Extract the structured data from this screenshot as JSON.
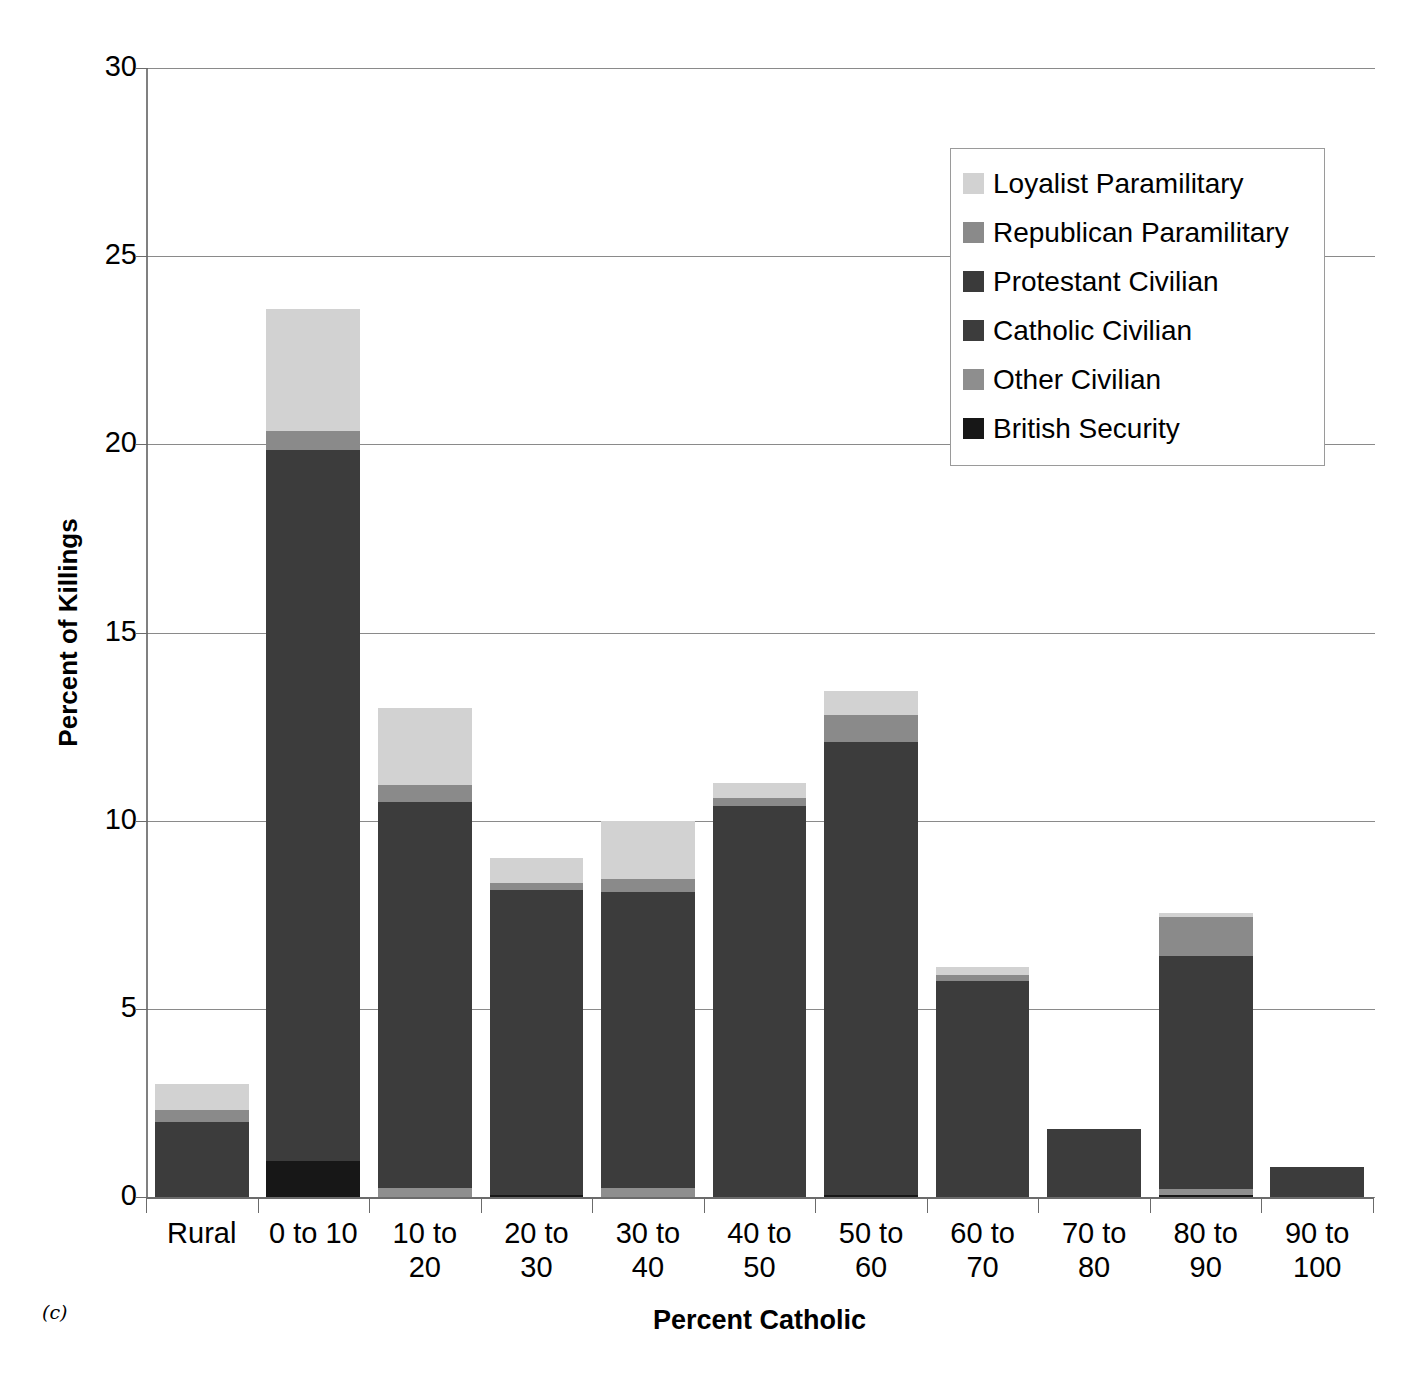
{
  "panel_tag": "(c)",
  "chart_data": {
    "type": "bar",
    "subtype": "stacked-bar",
    "title": "",
    "xlabel": "Percent Catholic",
    "ylabel": "Percent of Killings",
    "ylim": [
      0,
      30
    ],
    "yticks": [
      0,
      5,
      10,
      15,
      20,
      25,
      30
    ],
    "grid": "horizontal",
    "legend_position": "upper-right-inside",
    "categories": [
      "Rural",
      "0 to 10",
      "10 to 20",
      "20 to 30",
      "30 to 40",
      "40 to 50",
      "50 to 60",
      "60 to 70",
      "70 to 80",
      "80 to 90",
      "90 to 100"
    ],
    "series": [
      {
        "name": "British Security",
        "color": "#171717",
        "values": [
          0.0,
          0.95,
          0.0,
          0.05,
          0.0,
          0.0,
          0.05,
          0.0,
          0.0,
          0.05,
          0.0
        ]
      },
      {
        "name": "Other Civilian",
        "color": "#8e8e8e",
        "values": [
          0.0,
          0.0,
          0.25,
          0.0,
          0.25,
          0.0,
          0.0,
          0.0,
          0.0,
          0.15,
          0.0
        ]
      },
      {
        "name": "Catholic Civilian",
        "color": "#3c3c3c",
        "values": [
          2.0,
          18.9,
          10.25,
          8.1,
          7.85,
          10.4,
          12.05,
          5.75,
          1.8,
          6.2,
          0.8
        ]
      },
      {
        "name": "Protestant Civilian",
        "color": "#3a3a3a",
        "values": [
          0.0,
          0.0,
          0.0,
          0.0,
          0.0,
          0.0,
          0.0,
          0.0,
          0.0,
          0.0,
          0.0
        ]
      },
      {
        "name": "Republican Paramilitary",
        "color": "#8a8a8a",
        "values": [
          0.3,
          0.5,
          0.45,
          0.2,
          0.35,
          0.2,
          0.7,
          0.15,
          0.0,
          1.05,
          0.0
        ]
      },
      {
        "name": "Loyalist Paramilitary",
        "color": "#d2d2d2",
        "values": [
          0.7,
          3.25,
          2.05,
          0.65,
          1.55,
          0.4,
          0.65,
          0.2,
          0.0,
          0.1,
          0.0
        ]
      }
    ],
    "totals": [
      3.0,
      23.6,
      13.0,
      9.0,
      10.0,
      11.0,
      13.45,
      6.1,
      1.8,
      7.55,
      0.8
    ]
  },
  "legend": {
    "items": [
      {
        "label": "Loyalist Paramilitary",
        "color": "#d2d2d2"
      },
      {
        "label": "Republican Paramilitary",
        "color": "#8a8a8a"
      },
      {
        "label": "Protestant Civilian",
        "color": "#3a3a3a"
      },
      {
        "label": "Catholic Civilian",
        "color": "#3c3c3c"
      },
      {
        "label": "Other Civilian",
        "color": "#8e8e8e"
      },
      {
        "label": "British Security",
        "color": "#171717"
      }
    ]
  },
  "axes": {
    "y_tick_labels": [
      "30",
      "25",
      "20",
      "15",
      "10",
      "5",
      "0"
    ],
    "y_title": "Percent of Killings",
    "x_title": "Percent Catholic",
    "x_tick_labels": [
      [
        "Rural"
      ],
      [
        "0 to 10"
      ],
      [
        "10 to",
        "20"
      ],
      [
        "20 to",
        "30"
      ],
      [
        "30 to",
        "40"
      ],
      [
        "40 to",
        "50"
      ],
      [
        "50 to",
        "60"
      ],
      [
        "60 to",
        "70"
      ],
      [
        "70 to",
        "80"
      ],
      [
        "80 to",
        "90"
      ],
      [
        "90 to",
        "100"
      ]
    ]
  }
}
